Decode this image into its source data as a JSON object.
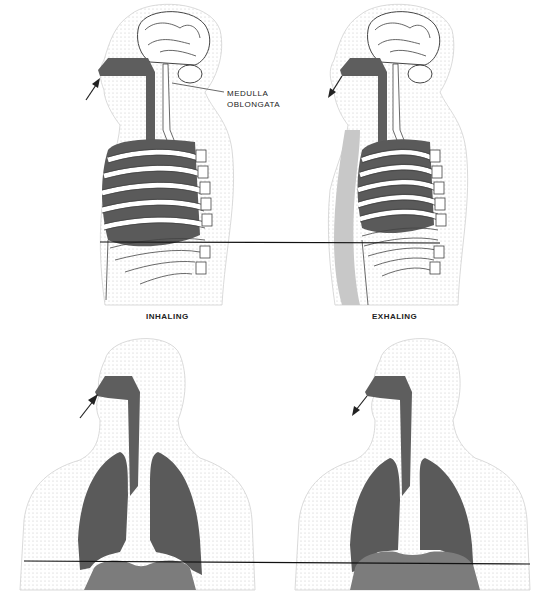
{
  "figure": {
    "labels": {
      "medulla_line1": "MEDULLA",
      "medulla_line2": "OBLONGATA",
      "inhaling": "INHALING",
      "exhaling": "EXHALING"
    },
    "panels": [
      {
        "id": "side-inhaling",
        "view": "sagittal",
        "phase": "inhaling",
        "arrow": "into-nose"
      },
      {
        "id": "side-exhaling",
        "view": "sagittal",
        "phase": "exhaling",
        "arrow": "out-of-nose"
      },
      {
        "id": "front-inhaling",
        "view": "frontal",
        "phase": "inhaling",
        "arrow": "into-nose"
      },
      {
        "id": "front-exhaling",
        "view": "frontal",
        "phase": "exhaling",
        "arrow": "out-of-nose"
      }
    ],
    "reference_lines": [
      {
        "name": "rib-level-line",
        "x1": 100,
        "y1": 242,
        "x2": 440,
        "y2": 243
      },
      {
        "name": "diaphragm-level-line",
        "x1": 24,
        "y1": 561,
        "x2": 530,
        "y2": 564
      }
    ],
    "colors": {
      "airway": "#5e5e5e",
      "lung": "#5a5a5a",
      "diaphragm": "#7c7c7c",
      "spine_shade": "#c8c8c8",
      "outline": "#333333",
      "stipple": "#bdbdbd"
    }
  }
}
